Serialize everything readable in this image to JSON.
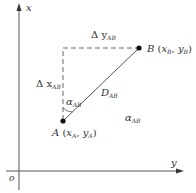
{
  "diagram": {
    "title": "",
    "axes": {
      "vertical_label": "x",
      "horizontal_label": "y",
      "origin_label": "o"
    },
    "points": {
      "A": {
        "name": "A",
        "coord_open": "(",
        "x_sym": "x",
        "x_sub": "A",
        "sep": ",",
        "y_sym": "y",
        "y_sub": "A",
        "coord_close": ")"
      },
      "B": {
        "name": "B",
        "coord_open": "(",
        "x_sym": "x",
        "x_sub": "B",
        "sep": ",",
        "y_sym": "y",
        "y_sub": "B",
        "coord_close": ")"
      }
    },
    "labels": {
      "delta_y": {
        "sym": "Δ y",
        "sub": "AB"
      },
      "delta_x": {
        "sym": "Δ x",
        "sub": "AB"
      },
      "angle_near": {
        "sym": "α",
        "sub": "AB"
      },
      "distance": {
        "sym": "D",
        "sub": "AB"
      },
      "angle_far": {
        "sym": "α",
        "sub": "AB"
      }
    },
    "colors": {
      "line": "#555555",
      "dashed": "#666666",
      "point": "#111111",
      "text": "#333333"
    }
  }
}
